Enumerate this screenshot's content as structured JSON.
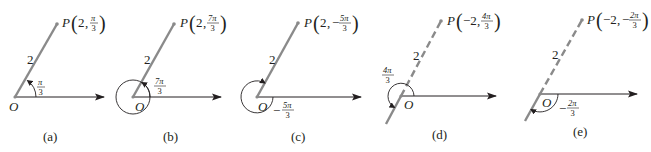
{
  "figure": {
    "panels": [
      {
        "id": "a",
        "caption": "(a)",
        "point_label": "P",
        "r": "2",
        "theta_num": "π",
        "theta_den": "3",
        "theta_sign": "",
        "r_sign": "",
        "length_label": "2",
        "origin_label": "O",
        "angle_num": "π",
        "angle_den": "3",
        "angle_sign": "",
        "ray_style": "solid"
      },
      {
        "id": "b",
        "caption": "(b)",
        "point_label": "P",
        "r": "2",
        "theta_num": "7π",
        "theta_den": "3",
        "theta_sign": "",
        "r_sign": "",
        "length_label": "2",
        "origin_label": "O",
        "angle_num": "7π",
        "angle_den": "3",
        "angle_sign": "",
        "ray_style": "solid"
      },
      {
        "id": "c",
        "caption": "(c)",
        "point_label": "P",
        "r": "2",
        "theta_num": "5π",
        "theta_den": "3",
        "theta_sign": "−",
        "r_sign": "",
        "length_label": "2",
        "origin_label": "O",
        "angle_num": "5π",
        "angle_den": "3",
        "angle_sign": "−",
        "ray_style": "solid"
      },
      {
        "id": "d",
        "caption": "(d)",
        "point_label": "P",
        "r": "−2",
        "theta_num": "4π",
        "theta_den": "3",
        "theta_sign": "",
        "length_label": "2",
        "origin_label": "O",
        "angle_num": "4π",
        "angle_den": "3",
        "angle_sign": "",
        "ray_style": "dashed"
      },
      {
        "id": "e",
        "caption": "(e)",
        "point_label": "P",
        "r": "−2",
        "theta_num": "2π",
        "theta_den": "3",
        "theta_sign": "−",
        "length_label": "2",
        "origin_label": "O",
        "angle_num": "2π",
        "angle_den": "3",
        "angle_sign": "−",
        "ray_style": "dashed"
      }
    ],
    "colors": {
      "ray": "#8a8a8a",
      "ink": "#231f20",
      "background": "#ffffff"
    }
  }
}
